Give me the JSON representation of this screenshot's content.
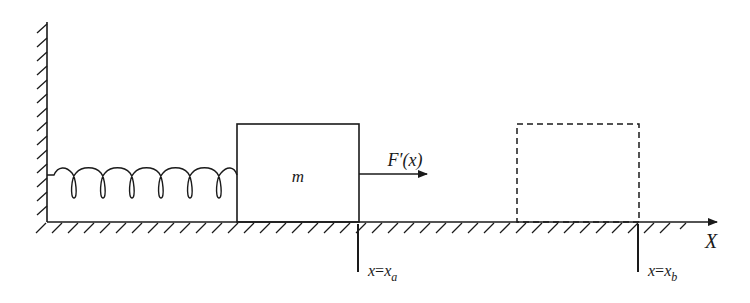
{
  "diagram": {
    "mass_label": "m",
    "force_label": "F′(x)",
    "axis_label": "X",
    "position_a": {
      "var": "x",
      "eq": "=",
      "sym": "x",
      "sub": "a"
    },
    "position_b": {
      "var": "x",
      "eq": "=",
      "sym": "x",
      "sub": "b"
    }
  },
  "colors": {
    "ink": "#1a1a1a",
    "background": "#ffffff"
  }
}
